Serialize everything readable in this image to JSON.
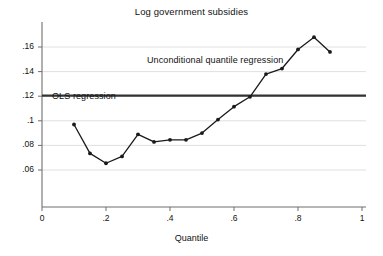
{
  "chart_data": {
    "type": "line",
    "title": "Log government subsidies",
    "xlabel": "Quantile",
    "ylabel": "",
    "xlim": [
      0,
      1
    ],
    "ylim": [
      0.055,
      0.172
    ],
    "grid": true,
    "legend_position": "inline-annotation",
    "xticks": [
      "0",
      ".2",
      ".4",
      ".6",
      ".8",
      "1"
    ],
    "xtick_values": [
      0,
      0.2,
      0.4,
      0.6,
      0.8,
      1
    ],
    "yticks": [
      ".06",
      ".08",
      ".1",
      ".12",
      ".14",
      ".16"
    ],
    "ytick_values": [
      0.06,
      0.08,
      0.1,
      0.12,
      0.14,
      0.16
    ],
    "series": [
      {
        "name": "Unconditional quantile regression",
        "type": "line-markers",
        "color": "#1a1a1a",
        "x": [
          0.1,
          0.15,
          0.2,
          0.25,
          0.3,
          0.35,
          0.4,
          0.45,
          0.5,
          0.55,
          0.6,
          0.65,
          0.7,
          0.75,
          0.8,
          0.85,
          0.9
        ],
        "values": [
          0.097,
          0.0735,
          0.0655,
          0.071,
          0.089,
          0.0828,
          0.0845,
          0.0845,
          0.09,
          0.101,
          0.1115,
          0.1195,
          0.138,
          0.1425,
          0.158,
          0.168,
          0.156
        ]
      },
      {
        "name": "OLS regression",
        "type": "hline",
        "color": "#333333",
        "value": 0.1205
      }
    ],
    "annotations": [
      {
        "name": "ols-label",
        "text": "OLS regression",
        "x": 0.065,
        "y": 0.1255
      },
      {
        "name": "series-label",
        "text": "Unconditional quantile regression",
        "x": 0.375,
        "y": 0.1525
      }
    ]
  },
  "labels": {
    "title": "Log government subsidies",
    "xaxis": "Quantile",
    "ols": "OLS regression",
    "uqr": "Unconditional quantile regression"
  },
  "colors": {
    "line": "#1a1a1a",
    "ols": "#333333",
    "grid": "#d8d8d8",
    "axis": "#6f6f6f",
    "text": "#111111",
    "background": "#ffffff"
  }
}
